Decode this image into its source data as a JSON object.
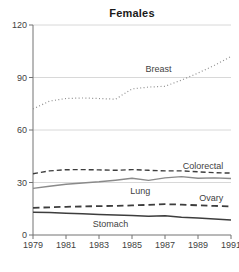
{
  "chart_data": {
    "type": "line",
    "title": "Females",
    "xlabel": "",
    "ylabel": "",
    "xlim": [
      1979,
      1991
    ],
    "ylim": [
      0,
      120
    ],
    "xticks": [
      1979,
      1981,
      1983,
      1985,
      1987,
      1989,
      1991
    ],
    "yticks": [
      0,
      30,
      60,
      90,
      120
    ],
    "grid": "horizontal",
    "legend_position": "inline-labels",
    "colors": {
      "axis": "#737373",
      "grid": "#d8d8d8",
      "tick_text": "#3f3f3f",
      "label_text": "#3f3f3f",
      "title_text": "#1a1a1a",
      "background": "#ffffff"
    },
    "x": [
      1979,
      1980,
      1981,
      1982,
      1983,
      1984,
      1985,
      1986,
      1987,
      1988,
      1989,
      1990,
      1991
    ],
    "series": [
      {
        "name": "Breast",
        "style": "dotted",
        "color": "#8f8f8f",
        "width": 1.2,
        "dash": "1 2.4",
        "label_at": {
          "x": 1986.6,
          "y": 95
        },
        "values": [
          72,
          76.5,
          78,
          78.3,
          78,
          77.6,
          83.5,
          84.5,
          85,
          88.5,
          92.5,
          97,
          102
        ]
      },
      {
        "name": "Colorectal",
        "style": "dashed",
        "color": "#3d3d3d",
        "width": 1.4,
        "dash": "5 3",
        "label_at": {
          "x": 1989.3,
          "y": 39.5
        },
        "values": [
          35,
          36.6,
          37.3,
          37.4,
          37.2,
          37,
          37.4,
          37,
          36.6,
          36.6,
          36.1,
          35.6,
          35.4
        ]
      },
      {
        "name": "Lung",
        "style": "solid",
        "color": "#8a8a8a",
        "width": 1.4,
        "dash": "",
        "label_at": {
          "x": 1985.5,
          "y": 25.3
        },
        "values": [
          26.6,
          27.9,
          29,
          29.7,
          30.4,
          31.3,
          32.4,
          31.2,
          32.6,
          33.4,
          32.4,
          32.6,
          32.3
        ]
      },
      {
        "name": "Ovary",
        "style": "dashed",
        "color": "#3d3d3d",
        "width": 1.8,
        "dash": "6.5 4",
        "label_at": {
          "x": 1989.8,
          "y": 21
        },
        "values": [
          15.5,
          15.8,
          16.1,
          16.3,
          16.5,
          16.6,
          16.9,
          17.2,
          17.6,
          17.4,
          17,
          16.6,
          16.3
        ]
      },
      {
        "name": "Stomach",
        "style": "solid",
        "color": "#3d3d3d",
        "width": 1.5,
        "dash": "",
        "label_at": {
          "x": 1983.7,
          "y": 6.2
        },
        "values": [
          13,
          12.8,
          12.4,
          12.1,
          11.7,
          11.4,
          11.1,
          10.7,
          11,
          10.2,
          9.7,
          9.1,
          8.6
        ]
      }
    ]
  }
}
